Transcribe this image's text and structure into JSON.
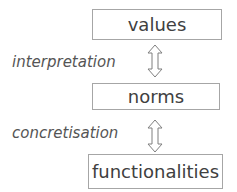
{
  "diagram": {
    "nodes": [
      {
        "id": "values",
        "label": "values"
      },
      {
        "id": "norms",
        "label": "norms"
      },
      {
        "id": "functionalities",
        "label": "functionalities"
      }
    ],
    "edges": [
      {
        "from": "values",
        "to": "norms",
        "label": "interpretation",
        "direction": "bidirectional"
      },
      {
        "from": "norms",
        "to": "functionalities",
        "label": "concretisation",
        "direction": "bidirectional"
      }
    ],
    "colors": {
      "border": "#a6a6a6",
      "text": "#404040",
      "arrow": "#7f7f7f"
    }
  }
}
